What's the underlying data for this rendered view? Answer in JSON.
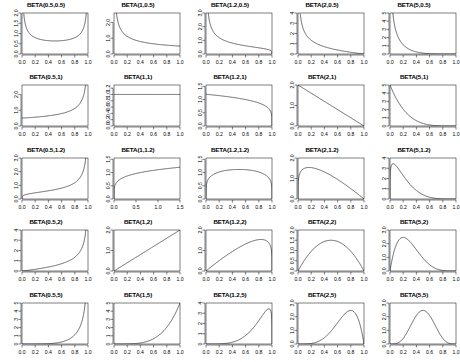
{
  "figure": {
    "type": "grid-of-plots",
    "rows": 5,
    "cols": 5,
    "background": "#ffffff",
    "line_color": "#000000"
  },
  "chart_data": [
    {
      "type": "line",
      "title": "BETA(0.5,0.5)",
      "xlabel": "",
      "ylabel": "",
      "xlim": [
        0,
        1
      ],
      "ylim": [
        0,
        2.0
      ],
      "xticks": [
        "0.0",
        "0.2",
        "0.4",
        "0.6",
        "0.8",
        "1.0"
      ],
      "yticks": [
        "0.0",
        "0.5",
        "1.0",
        "1.5",
        "2.0"
      ],
      "grid": false,
      "legend": "none",
      "alpha": 0.5,
      "beta": 0.5,
      "orientation": "mirrored",
      "shape": "u-shaped symmetric, minimum 0.64 at x=0.5, rising to axis limits at both ends"
    },
    {
      "type": "line",
      "title": "BETA(1,0.5)",
      "xlabel": "",
      "ylabel": "",
      "xlim": [
        0,
        1
      ],
      "ylim": [
        0,
        2.6
      ],
      "xticks": [
        "0.0",
        "0.2",
        "0.4",
        "0.6",
        "0.8",
        "1.0"
      ],
      "yticks": [
        "0.0",
        "1.0",
        "2.0"
      ],
      "grid": false,
      "legend": "none",
      "alpha": 1,
      "beta": 0.5,
      "orientation": "mirrored",
      "shape": "monotone decreasing, unbounded at x=0, approx 0.5 at x=1"
    },
    {
      "type": "line",
      "title": "BETA(1.2,0.5)",
      "xlabel": "",
      "ylabel": "",
      "xlim": [
        0,
        1
      ],
      "ylim": [
        0,
        3.0
      ],
      "xticks": [
        "0.0",
        "0.2",
        "0.4",
        "0.6",
        "0.8",
        "1.0"
      ],
      "yticks": [
        "0.0",
        "1.0",
        "2.0",
        "3.0"
      ],
      "grid": false,
      "legend": "none",
      "alpha": 1.2,
      "beta": 0.5,
      "orientation": "mirrored",
      "shape": "monotone decreasing, unbounded at x=0, dropping to 0 at x=1"
    },
    {
      "type": "line",
      "title": "BETA(2,0.5)",
      "xlabel": "",
      "ylabel": "",
      "xlim": [
        0,
        1
      ],
      "ylim": [
        0,
        4
      ],
      "xticks": [
        "0.0",
        "0.2",
        "0.4",
        "0.6",
        "0.8",
        "1.0"
      ],
      "yticks": [
        "0",
        "1",
        "2",
        "3",
        "4"
      ],
      "grid": false,
      "legend": "none",
      "alpha": 2,
      "beta": 0.5,
      "orientation": "mirrored",
      "shape": "steep monotone decreasing, unbounded at x=0, reaching 0 at x=1"
    },
    {
      "type": "line",
      "title": "BETA(5,0.5)",
      "xlabel": "",
      "ylabel": "",
      "xlim": [
        0,
        1
      ],
      "ylim": [
        0,
        5
      ],
      "xticks": [
        "0.0",
        "0.2",
        "0.4",
        "0.6",
        "0.8",
        "1.0"
      ],
      "yticks": [
        "0",
        "1",
        "2",
        "3",
        "4",
        "5"
      ],
      "grid": false,
      "legend": "none",
      "alpha": 5,
      "beta": 0.5,
      "orientation": "mirrored",
      "shape": "very steep monotone decreasing, near zero beyond x=0.4"
    },
    {
      "type": "line",
      "title": "BETA(0.5,1)",
      "xlabel": "",
      "ylabel": "",
      "xlim": [
        0,
        1
      ],
      "ylim": [
        0,
        2.6
      ],
      "xticks": [
        "0.0",
        "0.2",
        "0.4",
        "0.6",
        "0.8",
        "1.0"
      ],
      "yticks": [
        "0.0",
        "1.0",
        "2.0"
      ],
      "grid": false,
      "legend": "none",
      "alpha": 0.5,
      "beta": 1,
      "orientation": "mirrored",
      "shape": "monotone increasing, 0.5 at x=0, unbounded at x=1"
    },
    {
      "type": "line",
      "title": "BETA(1,1)",
      "xlabel": "",
      "ylabel": "",
      "xlim": [
        0,
        1
      ],
      "ylim": [
        0,
        1.3
      ],
      "xticks": [
        "0.0",
        "0.2",
        "0.4",
        "0.6",
        "0.8",
        "1.0"
      ],
      "yticks": [
        "0.0",
        "0.2",
        "0.4",
        "0.6",
        "0.8",
        "1.0",
        "1.2"
      ],
      "grid": false,
      "legend": "none",
      "alpha": 1,
      "beta": 1,
      "orientation": "mirrored",
      "shape": "flat uniform density at height 1.0"
    },
    {
      "type": "line",
      "title": "BETA(1.2,1)",
      "xlabel": "",
      "ylabel": "",
      "xlim": [
        0,
        1
      ],
      "ylim": [
        0,
        1.55
      ],
      "xticks": [
        "0.0",
        "0.2",
        "0.4",
        "0.6",
        "0.8",
        "1.0"
      ],
      "yticks": [
        "0.0",
        "0.5",
        "1.0",
        "1.5"
      ],
      "grid": false,
      "legend": "none",
      "alpha": 1.2,
      "beta": 1,
      "orientation": "mirrored",
      "shape": "gently decreasing from 1.2, dropping sharply to 0 at x=1"
    },
    {
      "type": "line",
      "title": "BETA(2,1)",
      "xlabel": "",
      "ylabel": "",
      "xlim": [
        0,
        1
      ],
      "ylim": [
        0,
        2.0
      ],
      "xticks": [
        "0.0",
        "0.2",
        "0.4",
        "0.6",
        "0.8",
        "1.0"
      ],
      "yticks": [
        "0.0",
        "1.0",
        "2.0"
      ],
      "grid": false,
      "legend": "none",
      "alpha": 2,
      "beta": 1,
      "orientation": "mirrored",
      "shape": "straight line decreasing from 2.0 at x=0 to 0 at x=1"
    },
    {
      "type": "line",
      "title": "BETA(5,1)",
      "xlabel": "",
      "ylabel": "",
      "xlim": [
        0,
        1
      ],
      "ylim": [
        0,
        5
      ],
      "xticks": [
        "0.0",
        "0.2",
        "0.4",
        "0.6",
        "0.8",
        "1.0"
      ],
      "yticks": [
        "0",
        "1",
        "2",
        "3",
        "4",
        "5"
      ],
      "grid": false,
      "legend": "none",
      "alpha": 5,
      "beta": 1,
      "orientation": "mirrored",
      "shape": "steep power decay from 5.0 at x=0 to 0 at x=1"
    },
    {
      "type": "line",
      "title": "BETA(0.5,1.2)",
      "xlabel": "",
      "ylabel": "",
      "xlim": [
        0,
        1
      ],
      "ylim": [
        0,
        3.0
      ],
      "xticks": [
        "0.0",
        "0.2",
        "0.4",
        "0.6",
        "0.8",
        "1.0"
      ],
      "yticks": [
        "0.0",
        "1.0",
        "2.0",
        "3.0"
      ],
      "grid": false,
      "legend": "none",
      "alpha": 0.5,
      "beta": 1.2,
      "orientation": "mirrored",
      "shape": "monotone increasing, near 0 at x=0, unbounded at x=1"
    },
    {
      "type": "line",
      "title": "BETA(1,1.2)",
      "xlabel": "",
      "ylabel": "",
      "xlim": [
        0,
        1
      ],
      "ylim": [
        0,
        1.55
      ],
      "xticks": [
        "0.0",
        "0.5",
        "1.0",
        "1.5"
      ],
      "yticks": [
        "0.0",
        "0.5",
        "1.0",
        "1.5"
      ],
      "grid": false,
      "legend": "none",
      "alpha": 1,
      "beta": 1.2,
      "orientation": "mirrored",
      "shape": "concave increasing from 0 to about 1.2 at x=1"
    },
    {
      "type": "line",
      "title": "BETA(1.2,1.2)",
      "xlabel": "",
      "ylabel": "",
      "xlim": [
        0,
        1
      ],
      "ylim": [
        0,
        1.55
      ],
      "xticks": [
        "0.0",
        "0.2",
        "0.4",
        "0.6",
        "0.8",
        "1.0"
      ],
      "yticks": [
        "0.0",
        "0.5",
        "1.0",
        "1.5"
      ],
      "grid": false,
      "legend": "none",
      "alpha": 1.2,
      "beta": 1.2,
      "orientation": "mirrored",
      "shape": "broad flat dome peaking about 1.15 near x=0.5, dropping at both ends"
    },
    {
      "type": "line",
      "title": "BETA(2,1.2)",
      "xlabel": "",
      "ylabel": "",
      "xlim": [
        0,
        1
      ],
      "ylim": [
        0,
        2.0
      ],
      "xticks": [
        "0.0",
        "0.2",
        "0.4",
        "0.6",
        "0.8",
        "1.0"
      ],
      "yticks": [
        "0.0",
        "1.0",
        "2.0"
      ],
      "grid": false,
      "legend": "none",
      "alpha": 2,
      "beta": 1.2,
      "orientation": "mirrored",
      "shape": "rises sharply to peak about 1.55 near x=0.2 then declines to 0 at x=1"
    },
    {
      "type": "line",
      "title": "BETA(5,1.2)",
      "xlabel": "",
      "ylabel": "",
      "xlim": [
        0,
        1
      ],
      "ylim": [
        0,
        4
      ],
      "xticks": [
        "0.0",
        "0.2",
        "0.4",
        "0.6",
        "0.8",
        "1.0"
      ],
      "yticks": [
        "0",
        "1",
        "2",
        "3",
        "4"
      ],
      "grid": false,
      "legend": "none",
      "alpha": 5,
      "beta": 1.2,
      "orientation": "mirrored",
      "shape": "sharp spike peaking about 3.0 near x=0.06 with long right tail"
    },
    {
      "type": "line",
      "title": "BETA(0.5,2)",
      "xlabel": "",
      "ylabel": "",
      "xlim": [
        0,
        1
      ],
      "ylim": [
        0,
        4
      ],
      "xticks": [
        "0.0",
        "0.2",
        "0.4",
        "0.6",
        "0.8",
        "1.0"
      ],
      "yticks": [
        "0",
        "1",
        "2",
        "3",
        "4"
      ],
      "grid": false,
      "legend": "none",
      "alpha": 0.5,
      "beta": 2,
      "orientation": "mirrored",
      "shape": "monotone increasing, flat near 0 then unbounded at x=1"
    },
    {
      "type": "line",
      "title": "BETA(1,2)",
      "xlabel": "",
      "ylabel": "",
      "xlim": [
        0,
        1
      ],
      "ylim": [
        0,
        2.0
      ],
      "xticks": [
        "0.0",
        "0.2",
        "0.4",
        "0.6",
        "0.8",
        "1.0"
      ],
      "yticks": [
        "0.0",
        "1.0",
        "2.0"
      ],
      "grid": false,
      "legend": "none",
      "alpha": 1,
      "beta": 2,
      "orientation": "mirrored",
      "shape": "straight line increasing from 0 at x=0 to 2.0 at x=1"
    },
    {
      "type": "line",
      "title": "BETA(1.2,2)",
      "xlabel": "",
      "ylabel": "",
      "xlim": [
        0,
        1
      ],
      "ylim": [
        0,
        2.0
      ],
      "xticks": [
        "0.0",
        "0.2",
        "0.4",
        "0.6",
        "0.8",
        "1.0"
      ],
      "yticks": [
        "0.0",
        "1.0",
        "2.0"
      ],
      "grid": false,
      "legend": "none",
      "alpha": 1.2,
      "beta": 2,
      "orientation": "mirrored",
      "shape": "rising curve peaking about 1.55 near x=0.85 then dropping sharply to 0 at x=1"
    },
    {
      "type": "line",
      "title": "BETA(2,2)",
      "xlabel": "",
      "ylabel": "",
      "xlim": [
        0,
        1
      ],
      "ylim": [
        0,
        2.0
      ],
      "xticks": [
        "0.0",
        "0.2",
        "0.4",
        "0.6",
        "0.8",
        "1.0"
      ],
      "yticks": [
        "0.0",
        "0.5",
        "1.0",
        "1.5",
        "2.0"
      ],
      "grid": false,
      "legend": "none",
      "alpha": 2,
      "beta": 2,
      "orientation": "mirrored",
      "shape": "symmetric dome peaking at 1.5 at x=0.5, zero at both ends"
    },
    {
      "type": "line",
      "title": "BETA(5,2)",
      "xlabel": "",
      "ylabel": "",
      "xlim": [
        0,
        1
      ],
      "ylim": [
        0,
        3.0
      ],
      "xticks": [
        "0.0",
        "0.2",
        "0.4",
        "0.6",
        "0.8",
        "1.0"
      ],
      "yticks": [
        "0.0",
        "1.0",
        "2.0",
        "3.0"
      ],
      "grid": false,
      "legend": "none",
      "alpha": 5,
      "beta": 2,
      "orientation": "mirrored",
      "shape": "right skewed peak about 2.45 near x=0.2 with long right tail"
    },
    {
      "type": "line",
      "title": "BETA(0.5,5)",
      "xlabel": "",
      "ylabel": "",
      "xlim": [
        0,
        1
      ],
      "ylim": [
        0,
        5
      ],
      "xticks": [
        "0.0",
        "0.2",
        "0.4",
        "0.6",
        "0.8",
        "1.0"
      ],
      "yticks": [
        "0",
        "1",
        "2",
        "3",
        "4",
        "5"
      ],
      "grid": false,
      "legend": "none",
      "alpha": 0.5,
      "beta": 5,
      "orientation": "mirrored",
      "shape": "flat near zero until x=0.6 then steeply unbounded at x=1"
    },
    {
      "type": "line",
      "title": "BETA(1,5)",
      "xlabel": "",
      "ylabel": "",
      "xlim": [
        0,
        1
      ],
      "ylim": [
        0,
        5
      ],
      "xticks": [
        "0.0",
        "0.2",
        "0.4",
        "0.6",
        "0.8",
        "1.0"
      ],
      "yticks": [
        "0",
        "1",
        "2",
        "3",
        "4",
        "5"
      ],
      "grid": false,
      "legend": "none",
      "alpha": 1,
      "beta": 5,
      "orientation": "mirrored",
      "shape": "power curve rising from 0 to 5.0 at x=1"
    },
    {
      "type": "line",
      "title": "BETA(1.2,5)",
      "xlabel": "",
      "ylabel": "",
      "xlim": [
        0,
        1
      ],
      "ylim": [
        0,
        4
      ],
      "xticks": [
        "0.0",
        "0.2",
        "0.4",
        "0.6",
        "0.8",
        "1.0"
      ],
      "yticks": [
        "0",
        "1",
        "2",
        "3",
        "4"
      ],
      "grid": false,
      "legend": "none",
      "alpha": 1.2,
      "beta": 5,
      "orientation": "mirrored",
      "shape": "rising to peak about 3.0 near x=0.95 then sharp drop to 0 at x=1"
    },
    {
      "type": "line",
      "title": "BETA(2,5)",
      "xlabel": "",
      "ylabel": "",
      "xlim": [
        0,
        1
      ],
      "ylim": [
        0,
        3.0
      ],
      "xticks": [
        "0.0",
        "0.2",
        "0.4",
        "0.6",
        "0.8",
        "1.0"
      ],
      "yticks": [
        "0.0",
        "1.0",
        "2.0",
        "3.0"
      ],
      "grid": false,
      "legend": "none",
      "alpha": 2,
      "beta": 5,
      "orientation": "mirrored",
      "shape": "left skewed peak about 2.45 near x=0.8 dropping to 0 at x=1"
    },
    {
      "type": "line",
      "title": "BETA(5,5)",
      "xlabel": "",
      "ylabel": "",
      "xlim": [
        0,
        1
      ],
      "ylim": [
        0,
        3.0
      ],
      "xticks": [
        "0.0",
        "0.2",
        "0.4",
        "0.6",
        "0.8",
        "1.0"
      ],
      "yticks": [
        "0.0",
        "1.0",
        "2.0",
        "3.0"
      ],
      "grid": false,
      "legend": "none",
      "alpha": 5,
      "beta": 5,
      "orientation": "mirrored",
      "shape": "symmetric bell peaking about 2.46 at x=0.5"
    }
  ]
}
